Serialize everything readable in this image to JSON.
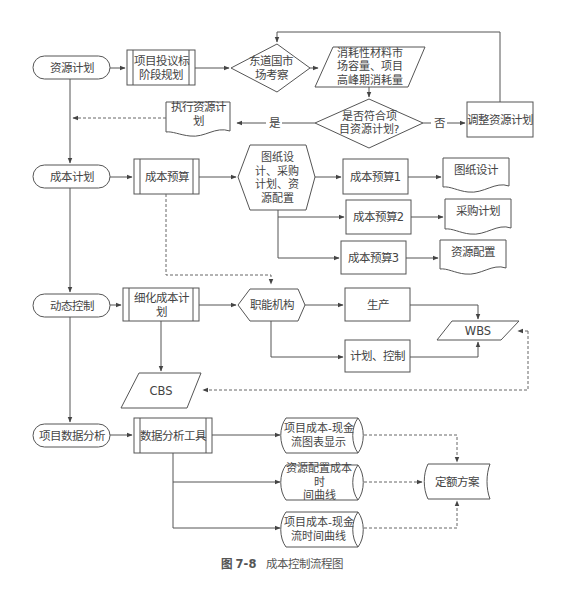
{
  "figure": {
    "caption_number": "图 7-8",
    "caption_title": "成本控制流程图"
  },
  "stages": {
    "resource_plan": "资源计划",
    "cost_plan": "成本计划",
    "dynamic_control": "动态控制",
    "data_analysis": "项目数据分析"
  },
  "row1": {
    "bid_planning": "项目投议标\n阶段规划",
    "market_survey": "东道国市\n场考察",
    "consumption": "消耗性材料市\n场容量、项目\n高峰期消耗量",
    "decision": "是否符合项\n目资源计划?",
    "yes_label": "是",
    "no_label": "否",
    "adjust": "调整资源计划",
    "execute": "执行资源计划"
  },
  "row2": {
    "cost_budget": "成本预算",
    "prep": "图纸设\n计、采购\n计划、资\n源配置",
    "budget1": "成本预算1",
    "budget2": "成本预算2",
    "budget3": "成本预算3",
    "doc1": "图纸设计",
    "doc2": "采购计划",
    "doc3": "资源配置"
  },
  "row3": {
    "detail_plan": "细化成本计划",
    "functions": "职能机构",
    "production": "生产",
    "plan_control": "计划、控制",
    "wbs": "WBS",
    "cbs": "CBS"
  },
  "row4": {
    "tools": "数据分析工具",
    "out1": "项目成本-现金\n流图表显示",
    "out2": "资源配置成本时\n间曲线",
    "out3": "项目成本-现金\n流时间曲线",
    "quota": "定额方案"
  }
}
